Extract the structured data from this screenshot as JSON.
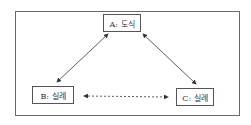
{
  "nodes": {
    "a": {
      "label": "A: 도식"
    },
    "b": {
      "label": "B: 실례"
    },
    "c": {
      "label": "C: 실례"
    }
  },
  "edges": [
    {
      "from": "A",
      "to": "B",
      "style": "solid",
      "direction": "bidirectional"
    },
    {
      "from": "A",
      "to": "C",
      "style": "solid",
      "direction": "bidirectional"
    },
    {
      "from": "B",
      "to": "C",
      "style": "dashed",
      "direction": "bidirectional"
    }
  ],
  "colors": {
    "line": "#333333",
    "border": "#555555"
  }
}
